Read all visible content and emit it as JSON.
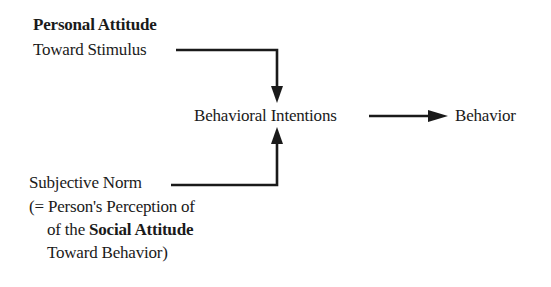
{
  "diagram": {
    "personal_attitude": {
      "title": "Personal Attitude",
      "subtitle": "Toward Stimulus"
    },
    "behavioral_intentions": "Behavioral Intentions",
    "behavior": "Behavior",
    "subjective_norm": {
      "title": "Subjective Norm",
      "line2": "(= Person's Perception of",
      "line3_prefix": "of the ",
      "line3_bold": "Social Attitude",
      "line4": "Toward Behavior)"
    },
    "colors": {
      "line": "#1a1a1a",
      "background": "#ffffff"
    }
  }
}
